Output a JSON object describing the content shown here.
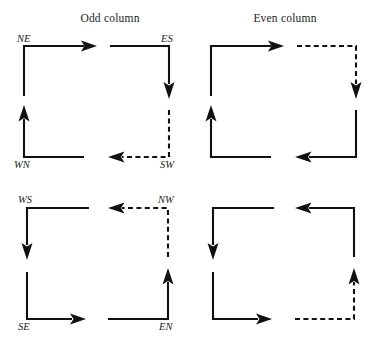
{
  "figure": {
    "type": "diagram",
    "background_color": "#ffffff",
    "stroke_color": "#111111",
    "headers": [
      {
        "id": "odd",
        "label": "Odd column"
      },
      {
        "id": "even",
        "label": "Even column"
      }
    ],
    "cells": [
      {
        "id": "ne",
        "label": "NE",
        "column": "odd",
        "row": 1,
        "col_in_group": 1,
        "line_style": "solid",
        "enter": "from-bottom",
        "exit": "to-right",
        "corner": "top-left"
      },
      {
        "id": "es",
        "label": "ES",
        "column": "odd",
        "row": 1,
        "col_in_group": 2,
        "line_style": "solid",
        "enter": "from-left",
        "exit": "to-bottom",
        "corner": "top-right"
      },
      {
        "id": "even-r1c1",
        "label": "",
        "column": "even",
        "row": 1,
        "col_in_group": 1,
        "line_style": "solid",
        "enter": "from-bottom",
        "exit": "to-right",
        "corner": "top-left"
      },
      {
        "id": "even-r1c2",
        "label": "",
        "column": "even",
        "row": 1,
        "col_in_group": 2,
        "line_style": "dashed",
        "enter": "from-left",
        "exit": "to-bottom",
        "corner": "top-right"
      },
      {
        "id": "wn",
        "label": "WN",
        "column": "odd",
        "row": 2,
        "col_in_group": 1,
        "line_style": "solid",
        "enter": "from-right",
        "exit": "to-top",
        "corner": "bottom-left"
      },
      {
        "id": "sw",
        "label": "SW",
        "column": "odd",
        "row": 2,
        "col_in_group": 2,
        "line_style": "dashed",
        "enter": "from-top",
        "exit": "to-left",
        "corner": "bottom-right"
      },
      {
        "id": "even-r2c1",
        "label": "",
        "column": "even",
        "row": 2,
        "col_in_group": 1,
        "line_style": "solid",
        "enter": "from-right",
        "exit": "to-top",
        "corner": "bottom-left"
      },
      {
        "id": "even-r2c2",
        "label": "",
        "column": "even",
        "row": 2,
        "col_in_group": 2,
        "line_style": "solid",
        "enter": "from-top",
        "exit": "to-left",
        "corner": "bottom-right"
      },
      {
        "id": "ws",
        "label": "WS",
        "column": "odd",
        "row": 3,
        "col_in_group": 1,
        "line_style": "solid",
        "enter": "from-right",
        "exit": "to-bottom",
        "corner": "top-left"
      },
      {
        "id": "nw",
        "label": "NW",
        "column": "odd",
        "row": 3,
        "col_in_group": 2,
        "line_style": "dashed",
        "enter": "from-bottom",
        "exit": "to-left",
        "corner": "top-right"
      },
      {
        "id": "even-r3c1",
        "label": "",
        "column": "even",
        "row": 3,
        "col_in_group": 1,
        "line_style": "solid",
        "enter": "from-right",
        "exit": "to-bottom",
        "corner": "top-left"
      },
      {
        "id": "even-r3c2",
        "label": "",
        "column": "even",
        "row": 3,
        "col_in_group": 2,
        "line_style": "solid",
        "enter": "from-bottom",
        "exit": "to-left",
        "corner": "top-right"
      },
      {
        "id": "se",
        "label": "SE",
        "column": "odd",
        "row": 4,
        "col_in_group": 1,
        "line_style": "solid",
        "enter": "from-top",
        "exit": "to-right",
        "corner": "bottom-left"
      },
      {
        "id": "en",
        "label": "EN",
        "column": "odd",
        "row": 4,
        "col_in_group": 2,
        "line_style": "solid",
        "enter": "from-left",
        "exit": "to-top",
        "corner": "bottom-right"
      },
      {
        "id": "even-r4c1",
        "label": "",
        "column": "even",
        "row": 4,
        "col_in_group": 1,
        "line_style": "solid",
        "enter": "from-top",
        "exit": "to-right",
        "corner": "bottom-left"
      },
      {
        "id": "even-r4c2",
        "label": "",
        "column": "even",
        "row": 4,
        "col_in_group": 2,
        "line_style": "dashed",
        "enter": "from-left",
        "exit": "to-top",
        "corner": "bottom-right"
      }
    ],
    "labels": {
      "ne": "NE",
      "es": "ES",
      "wn": "WN",
      "sw": "SW",
      "ws": "WS",
      "nw": "NW",
      "se": "SE",
      "en": "EN"
    }
  }
}
